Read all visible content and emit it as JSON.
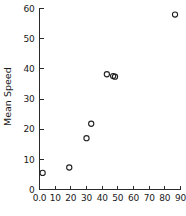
{
  "chart_data": {
    "type": "scatter",
    "title": "",
    "xlabel": "",
    "ylabel": "Mean Speed",
    "xlim": [
      0,
      90
    ],
    "ylim": [
      0,
      60
    ],
    "xticks": [
      0,
      10,
      20,
      30,
      40,
      50,
      60,
      70,
      80,
      90
    ],
    "xticklabels": [
      "0.0",
      "10",
      "20",
      "30",
      "40",
      "50",
      "60",
      "70",
      "80",
      "90"
    ],
    "yticks": [
      0,
      10,
      20,
      30,
      40,
      50,
      60
    ],
    "yticklabels": [
      "0",
      "10",
      "20",
      "30",
      "40",
      "50",
      "60"
    ],
    "grid": false,
    "legend": null,
    "marker": "open-circle",
    "points": [
      {
        "x": 2.0,
        "y": 5.5
      },
      {
        "x": 19.0,
        "y": 7.3
      },
      {
        "x": 30.0,
        "y": 17.0
      },
      {
        "x": 33.0,
        "y": 21.8
      },
      {
        "x": 43.0,
        "y": 38.2
      },
      {
        "x": 47.0,
        "y": 37.6
      },
      {
        "x": 48.2,
        "y": 37.4
      },
      {
        "x": 86.5,
        "y": 58.0
      }
    ],
    "series": [
      {
        "name": "Mean Speed",
        "x": [
          2.0,
          19.0,
          30.0,
          33.0,
          43.0,
          47.0,
          48.2,
          86.5
        ],
        "values": [
          5.5,
          7.3,
          17.0,
          21.8,
          38.2,
          37.6,
          37.4,
          58.0
        ]
      }
    ],
    "colors": {
      "marker_stroke": "#222222",
      "axis": "#2a2a2a",
      "background": "#ffffff"
    }
  }
}
